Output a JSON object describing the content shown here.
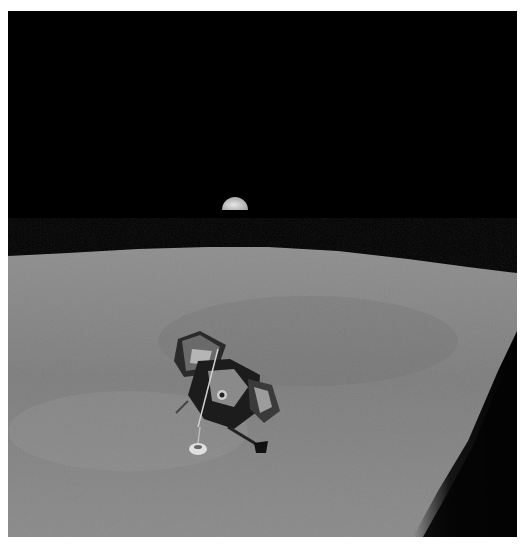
{
  "image": {
    "subject": "Lunar module ascending above the Moon's surface with Earth rising over the horizon",
    "colors": {
      "space": "#000000",
      "lunar_surface": "#8a8a8a",
      "lunar_surface_dark": "#6e6e6e",
      "earth": "#d8d8d8",
      "border": "#ffffff",
      "window_frame": "#050505"
    },
    "elements": [
      "earth",
      "lunar-horizon",
      "lunar-surface",
      "lunar-module",
      "spacecraft-window-frame"
    ]
  }
}
